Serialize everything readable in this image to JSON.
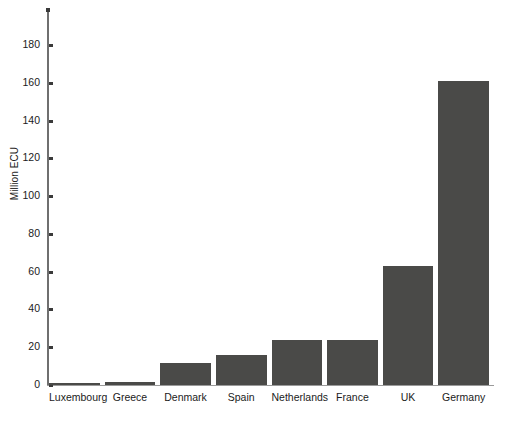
{
  "chart_data": {
    "type": "bar",
    "title": "",
    "subtitle": "",
    "xlabel": "",
    "ylabel": "Million ECU",
    "categories": [
      "Luxembourg",
      "Greece",
      "Denmark",
      "Spain",
      "Netherlands",
      "France",
      "UK",
      "Germany"
    ],
    "values": [
      1,
      1.5,
      11.5,
      16,
      24,
      24,
      63,
      161
    ],
    "ylim": [
      0,
      190
    ],
    "ytick_labels": [
      "0",
      "20",
      "40",
      "60",
      "80",
      "100",
      "120",
      "140",
      "160",
      "180"
    ],
    "ytick_values": [
      0,
      20,
      40,
      60,
      80,
      100,
      120,
      140,
      160,
      180
    ],
    "grid": false,
    "legend": null,
    "legend_position": "none",
    "bar_color": "#4a4a48",
    "axis_color": "#6f6f6f",
    "background_color": "#ffffff",
    "text_color": "#1b1b1b"
  }
}
